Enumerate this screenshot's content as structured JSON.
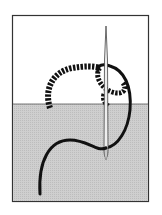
{
  "illustration": {
    "subject": "embroidery stitch with needle and thread",
    "colors": {
      "background": "#ffffff",
      "frame": "#333333",
      "fabric": "#c8c8c8",
      "upper": "#ffffff",
      "thread": "#111111",
      "needle": "#888888"
    }
  }
}
